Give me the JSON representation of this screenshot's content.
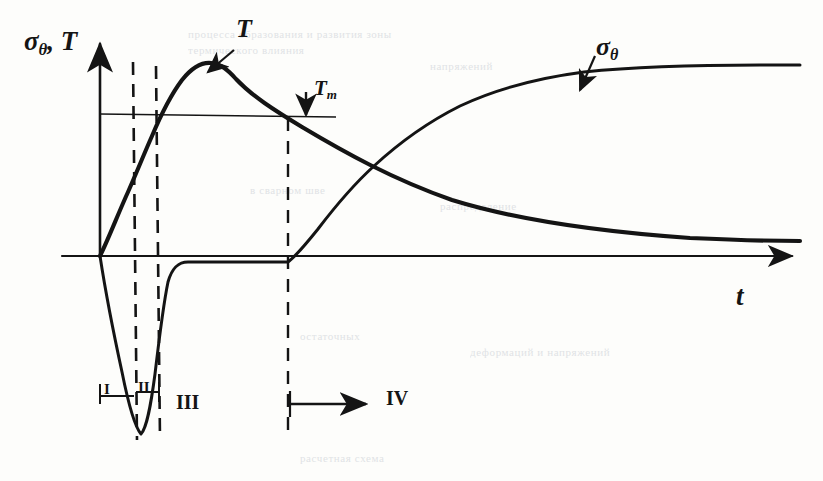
{
  "figure": {
    "kind": "hand-drawn-line-plot",
    "caption_present": false,
    "axes": {
      "y_label": "σ",
      "y_label_sub": "θ",
      "y_label_tail": ", T",
      "y_label_full": "σθ, T",
      "x_label": "t",
      "origin_px": [
        100,
        256
      ],
      "y_axis_top_px": 36,
      "x_axis_right_px": 800
    },
    "annotations": [
      {
        "id": "temperature-curve-label",
        "text": "T",
        "text_main": "T",
        "x": 238,
        "y": 22,
        "arrow_from": [
          232,
          52
        ],
        "arrow_to": [
          206,
          73
        ]
      },
      {
        "id": "stress-curve-label",
        "text": "σθ",
        "text_main": "σ",
        "text_sub": "θ",
        "x": 600,
        "y": 38,
        "arrow_from": [
          594,
          58
        ],
        "arrow_to": [
          578,
          89
        ]
      },
      {
        "id": "melting-level-label",
        "text": "Tm",
        "text_main": "T",
        "text_sub": "m",
        "x": 315,
        "y": 80,
        "arrow_from": [
          306,
          95
        ],
        "arrow_to": [
          306,
          116
        ]
      }
    ],
    "level_lines": [
      {
        "id": "Tm-level",
        "label": "Tm",
        "y": 114,
        "x_start": 100,
        "x_end": 336
      }
    ],
    "stage_markers": [
      {
        "id": "stage-1",
        "label": "I",
        "x": 104,
        "y": 386,
        "type": "numeral"
      },
      {
        "id": "stage-2",
        "label": "II",
        "x": 132,
        "y": 384,
        "type": "numeral"
      },
      {
        "id": "stage-3",
        "label": "III",
        "x": 176,
        "y": 398,
        "type": "numeral"
      },
      {
        "id": "stage-4",
        "label": "IV",
        "x": 388,
        "y": 393,
        "type": "numeral"
      }
    ],
    "dividers": [
      {
        "id": "divider-a",
        "x": 133,
        "y_top": 62,
        "y_bottom": 440,
        "style": "dashed"
      },
      {
        "id": "divider-b",
        "x": 156,
        "y_top": 66,
        "y_bottom": 440,
        "style": "dashed"
      },
      {
        "id": "divider-c",
        "x": 288,
        "y_top": 118,
        "y_bottom": 437,
        "style": "dashed"
      }
    ],
    "stage4_arrow": {
      "x_start": 290,
      "x_end": 368,
      "y": 404
    },
    "dimension_brackets": [
      {
        "id": "bracket-I",
        "x_start": 100,
        "x_end": 133,
        "y": 395
      },
      {
        "id": "bracket-II",
        "x_start": 133,
        "x_end": 158,
        "y": 392
      }
    ],
    "curves": [
      {
        "id": "temperature-curve",
        "name": "T",
        "description": "rises steeply from origin, peaks above Tm, then decays toward a low plateau",
        "points": [
          [
            100,
            256
          ],
          [
            112,
            228
          ],
          [
            126,
            196
          ],
          [
            140,
            164
          ],
          [
            150,
            142
          ],
          [
            158,
            120
          ],
          [
            166,
            100
          ],
          [
            175,
            84
          ],
          [
            185,
            72
          ],
          [
            196,
            65
          ],
          [
            208,
            63
          ],
          [
            220,
            66
          ],
          [
            232,
            74
          ],
          [
            250,
            88
          ],
          [
            272,
            104
          ],
          [
            300,
            124
          ],
          [
            340,
            150
          ],
          [
            390,
            176
          ],
          [
            450,
            199
          ],
          [
            520,
            217
          ],
          [
            600,
            229
          ],
          [
            680,
            236
          ],
          [
            760,
            240
          ],
          [
            800,
            241
          ]
        ]
      },
      {
        "id": "stress-curve",
        "name": "σθ",
        "description": "plunges to a deep negative minimum in stages I-II, returns to near zero through stage III, then rises sigmoidally to a positive plateau in stage IV",
        "points": [
          [
            100,
            256
          ],
          [
            106,
            290
          ],
          [
            114,
            330
          ],
          [
            122,
            375
          ],
          [
            130,
            412
          ],
          [
            136,
            428
          ],
          [
            141,
            434
          ],
          [
            146,
            424
          ],
          [
            150,
            402
          ],
          [
            154,
            368
          ],
          [
            158,
            330
          ],
          [
            162,
            298
          ],
          [
            166,
            278
          ],
          [
            170,
            268
          ],
          [
            176,
            263
          ],
          [
            186,
            262
          ],
          [
            210,
            262
          ],
          [
            250,
            262
          ],
          [
            288,
            262
          ],
          [
            300,
            252
          ],
          [
            316,
            232
          ],
          [
            336,
            208
          ],
          [
            360,
            182
          ],
          [
            388,
            156
          ],
          [
            420,
            133
          ],
          [
            455,
            113
          ],
          [
            492,
            97
          ],
          [
            530,
            85
          ],
          [
            570,
            77
          ],
          [
            615,
            71
          ],
          [
            660,
            68
          ],
          [
            710,
            66
          ],
          [
            760,
            66
          ],
          [
            800,
            66
          ]
        ]
      }
    ],
    "crossing_point_px": [
      455,
      176
    ]
  },
  "background_text": {
    "note": "faint show-through text from the printed page behind the figure",
    "lines": [
      {
        "text": "процесса  образования  и  развития  зоны",
        "x": 188,
        "y": 28
      },
      {
        "text": "термического  влияния",
        "x": 188,
        "y": 44
      },
      {
        "text": "напряжений",
        "x": 430,
        "y": 60
      },
      {
        "text": "в  сварном  шве",
        "x": 250,
        "y": 184
      },
      {
        "text": "распределение",
        "x": 440,
        "y": 200
      },
      {
        "text": "остаточных",
        "x": 300,
        "y": 330
      },
      {
        "text": "деформаций  и  напряжений",
        "x": 470,
        "y": 346
      },
      {
        "text": "расчетная  схема",
        "x": 300,
        "y": 452
      }
    ]
  },
  "colors": {
    "ink": "#141414",
    "paper": "#fdfdfb",
    "ghost": "#c9cdd4"
  }
}
